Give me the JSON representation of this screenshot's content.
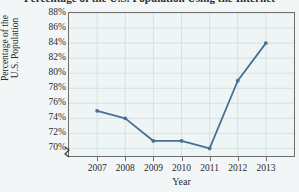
{
  "chart_data": {
    "type": "line",
    "title": "Percentage of the U.S. Population Using the Internet",
    "xlabel": "Year",
    "ylabel_line1": "Percentage of the",
    "ylabel_line2": "U.S. Population",
    "categories": [
      "2007",
      "2008",
      "2009",
      "2010",
      "2011",
      "2012",
      "2013"
    ],
    "values": [
      75,
      74,
      71,
      71,
      70,
      79,
      84
    ],
    "ytick_labels": [
      "88%",
      "86%",
      "84%",
      "82%",
      "80%",
      "78%",
      "76%",
      "74%",
      "72%",
      "70%"
    ],
    "ytick_values": [
      88,
      86,
      84,
      82,
      80,
      78,
      76,
      74,
      72,
      70
    ],
    "ylim": [
      69,
      88
    ],
    "grid": true,
    "legend": "none",
    "axis_break": true,
    "series_color": "#4a6e96",
    "grid_color": "#cfdede",
    "plot_background": "#eef5f4",
    "axis_color": "#6d6d6d"
  }
}
